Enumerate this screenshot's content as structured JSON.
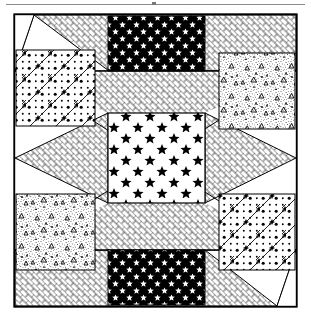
{
  "figure": {
    "kind": "quilt-block-diagram",
    "title_rule_present": true,
    "canvas": {
      "width": 311,
      "height": 322,
      "background": "#ffffff"
    },
    "frame": {
      "name": "outer-block-border",
      "x": 14,
      "y": 14,
      "width": 283,
      "height": 293,
      "stroke": "#000000",
      "stroke_width": 1.2,
      "fill": "#ffffff"
    },
    "colors": {
      "ink": "#000000",
      "paper": "#ffffff",
      "rule": "#8a8a8a",
      "pattern_gray": "#6f6f6f"
    },
    "grid": {
      "columns": 3,
      "rows": 3,
      "col_edges": [
        14,
        108,
        205,
        297
      ],
      "row_edges": [
        14,
        113,
        203,
        307
      ]
    },
    "patches": [
      {
        "id": "top-left-corner",
        "label": "Top Left Corner Square",
        "pattern": "polka-dot-diagonal",
        "pattern_label": "Polka Dot with Diagonal Chain",
        "shape": "square",
        "x": 16,
        "y": 50,
        "width": 79,
        "height": 76
      },
      {
        "id": "top-center-bar",
        "label": "Top Center Rectangle",
        "pattern": "black-white-stars",
        "pattern_label": "White Stars on Black",
        "shape": "rectangle",
        "x": 108,
        "y": 16,
        "width": 97,
        "height": 55
      },
      {
        "id": "top-right-corner",
        "label": "Top Right Corner Square",
        "pattern": "speckle-triangles",
        "pattern_label": "Speckled Triangles",
        "shape": "square",
        "x": 219,
        "y": 53,
        "width": 76,
        "height": 76
      },
      {
        "id": "center-star-square",
        "label": "Center Star Square",
        "pattern": "black-stars-on-white",
        "pattern_label": "Black Stars on White",
        "shape": "square",
        "x": 108,
        "y": 113,
        "width": 97,
        "height": 90
      },
      {
        "id": "bottom-left-corner",
        "label": "Bottom Left Corner Square",
        "pattern": "speckle-triangles",
        "pattern_label": "Speckled Triangles",
        "shape": "square",
        "x": 16,
        "y": 194,
        "width": 79,
        "height": 76
      },
      {
        "id": "bottom-center-bar",
        "label": "Bottom Center Rectangle",
        "pattern": "black-white-stars",
        "pattern_label": "White Stars on Black",
        "shape": "rectangle",
        "x": 108,
        "y": 250,
        "width": 97,
        "height": 55
      },
      {
        "id": "bottom-right-corner",
        "label": "Bottom Right Corner Square",
        "pattern": "polka-dot-diagonal",
        "pattern_label": "Polka Dot with Diagonal Chain",
        "shape": "square",
        "x": 219,
        "y": 194,
        "width": 76,
        "height": 76
      }
    ],
    "triangles": [
      {
        "id": "top-left-herringbone",
        "label": "Top Left Herringbone Triangle",
        "pattern": "herringbone",
        "points": "34,16 295,16 295,71 108,71"
      },
      {
        "id": "upper-x-triangle",
        "label": "Upper Center Herringbone Triangle",
        "pattern": "herringbone",
        "points": "16,71 295,71 155,160"
      },
      {
        "id": "left-point-triangle",
        "label": "Left Herringbone Point",
        "pattern": "herringbone",
        "points": "108,113 108,203 16,158"
      },
      {
        "id": "right-point-triangle",
        "label": "Right Herringbone Point",
        "pattern": "herringbone",
        "points": "205,113 205,203 295,158"
      },
      {
        "id": "lower-x-triangle",
        "label": "Lower Center Herringbone Triangle",
        "pattern": "herringbone",
        "points": "16,250 295,250 155,160"
      },
      {
        "id": "bottom-right-herringbone",
        "label": "Bottom Right Herringbone Triangle",
        "pattern": "herringbone",
        "points": "16,250 205,250 277,305 16,305"
      }
    ],
    "pattern_legend": [
      {
        "key": "herringbone",
        "name": "Herringbone Basketweave"
      },
      {
        "key": "black-white-stars",
        "name": "White Stars on Black"
      },
      {
        "key": "black-stars-on-white",
        "name": "Black Stars on White"
      },
      {
        "key": "polka-dot-diagonal",
        "name": "Polka Dot with Diagonal Chain"
      },
      {
        "key": "speckle-triangles",
        "name": "Speckled Triangles"
      }
    ]
  }
}
